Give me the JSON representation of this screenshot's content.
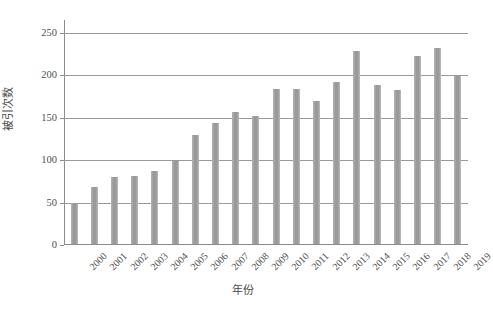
{
  "chart_data": {
    "type": "bar",
    "title": "",
    "xlabel": "年份",
    "ylabel": "被引次数",
    "categories": [
      "2000",
      "2001",
      "2002",
      "2003",
      "2004",
      "2005",
      "2006",
      "2007",
      "2008",
      "2009",
      "2010",
      "2011",
      "2012",
      "2013",
      "2014",
      "2015",
      "2016",
      "2017",
      "2018",
      "2019"
    ],
    "values": [
      48,
      67,
      79,
      80,
      86,
      98,
      128,
      142,
      156,
      151,
      182,
      182,
      169,
      191,
      227,
      187,
      181,
      222,
      231,
      198
    ],
    "series": [
      {
        "name": "被引次数",
        "values": [
          48,
          67,
          79,
          80,
          86,
          98,
          128,
          142,
          156,
          151,
          182,
          182,
          169,
          191,
          227,
          187,
          181,
          222,
          231,
          198
        ]
      }
    ],
    "ylim": [
      0,
      265
    ],
    "yticks": [
      0,
      50,
      100,
      150,
      200,
      250
    ],
    "ytick_labels": [
      "0",
      "50",
      "100",
      "150",
      "200",
      "250"
    ],
    "grid": true,
    "grid_axis": "y",
    "legend": false,
    "legend_position": "none",
    "bar_color": "#a0a0a0",
    "axis_color": "#8c8c8c",
    "gridline_color": "#9a9a9a",
    "text_color": "#4f4f4f",
    "background_color": "#ffffff",
    "xtick_rotation_degrees": -45
  }
}
